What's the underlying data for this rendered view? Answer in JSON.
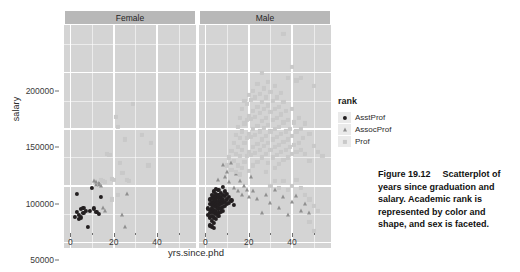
{
  "figure": {
    "caption_label": "Figure 19.12",
    "caption_text": "Scatterplot of years since graduation and salary. Academic rank is represented by color and shape, and sex is faceted."
  },
  "legend": {
    "title": "rank",
    "items": [
      {
        "label": "AsstProf",
        "shape": "circle",
        "color": "#231f20"
      },
      {
        "label": "AssocProf",
        "shape": "triangle",
        "color": "#8f8f8f"
      },
      {
        "label": "Prof",
        "shape": "square",
        "color": "#c9c9c9"
      }
    ]
  },
  "chart_data": {
    "type": "scatter",
    "title": "",
    "xlabel": "yrs.since.phd",
    "ylabel": "salary",
    "xlim": [
      -3,
      58
    ],
    "ylim": [
      45000,
      242000
    ],
    "grid": true,
    "legend_position": "right",
    "facet_variable": "sex",
    "facets": [
      "Female",
      "Male"
    ],
    "x_ticks": [
      0,
      20,
      40
    ],
    "x_tick_labels": [
      "0",
      "20",
      "40"
    ],
    "x_minor_ticks": [
      10,
      30,
      50
    ],
    "y_ticks": [
      50000,
      100000,
      150000,
      200000
    ],
    "y_tick_labels": [
      "50000",
      "100000",
      "150000",
      "200000"
    ],
    "y_minor_ticks": [
      75000,
      125000,
      175000,
      225000
    ],
    "color_variable": "rank",
    "shape_variable": "rank",
    "series": [
      {
        "name": "AsstProf",
        "facet": "Female",
        "shape": "circle",
        "color": "#231f20",
        "points": [
          [
            2,
            72500
          ],
          [
            3,
            93000
          ],
          [
            3,
            77000
          ],
          [
            4,
            74000
          ],
          [
            4,
            71000
          ],
          [
            5,
            79500
          ],
          [
            5,
            72000
          ],
          [
            6,
            80500
          ],
          [
            6,
            76000
          ],
          [
            7,
            77500
          ],
          [
            8,
            63500
          ],
          [
            9,
            78000
          ],
          [
            10,
            98000
          ],
          [
            11,
            80000
          ],
          [
            12,
            77000
          ],
          [
            13,
            75000
          ],
          [
            14,
            90000
          ]
        ]
      },
      {
        "name": "AssocProf",
        "facet": "Female",
        "shape": "triangle",
        "color": "#8f8f8f",
        "points": [
          [
            11,
            104000
          ],
          [
            12,
            103000
          ],
          [
            12,
            101000
          ],
          [
            13,
            102000
          ],
          [
            13,
            100500
          ],
          [
            14,
            99500
          ],
          [
            15,
            80000
          ],
          [
            16,
            78000
          ],
          [
            24,
            74000
          ],
          [
            25,
            63500
          ],
          [
            26,
            93000
          ]
        ]
      },
      {
        "name": "Prof",
        "facet": "Female",
        "shape": "square",
        "color": "#c9c9c9",
        "points": [
          [
            14,
            105000
          ],
          [
            15,
            104000
          ],
          [
            16,
            103500
          ],
          [
            17,
            128000
          ],
          [
            18,
            127000
          ],
          [
            19,
            106000
          ],
          [
            20,
            105000
          ],
          [
            21,
            161000
          ],
          [
            22,
            152000
          ],
          [
            23,
            120000
          ],
          [
            24,
            111000
          ],
          [
            25,
            141000
          ],
          [
            26,
            105000
          ],
          [
            27,
            104000
          ],
          [
            29,
            172000
          ],
          [
            33,
            145000
          ],
          [
            36,
            118000
          ],
          [
            37,
            138000
          ],
          [
            19,
            88000
          ],
          [
            22,
            92000
          ]
        ]
      },
      {
        "name": "AsstProf",
        "facet": "Male",
        "shape": "circle",
        "color": "#231f20",
        "points": [
          [
            1,
            80000
          ],
          [
            1,
            74000
          ],
          [
            2,
            88000
          ],
          [
            2,
            84000
          ],
          [
            2,
            79000
          ],
          [
            2,
            76000
          ],
          [
            2,
            72000
          ],
          [
            3,
            92000
          ],
          [
            3,
            89000
          ],
          [
            3,
            86000
          ],
          [
            3,
            83000
          ],
          [
            3,
            80000
          ],
          [
            3,
            77000
          ],
          [
            3,
            73000
          ],
          [
            3,
            69000
          ],
          [
            4,
            95000
          ],
          [
            4,
            91000
          ],
          [
            4,
            88000
          ],
          [
            4,
            85000
          ],
          [
            4,
            82000
          ],
          [
            4,
            79000
          ],
          [
            4,
            76000
          ],
          [
            4,
            72000
          ],
          [
            4,
            67000
          ],
          [
            5,
            97000
          ],
          [
            5,
            93000
          ],
          [
            5,
            90000
          ],
          [
            5,
            87000
          ],
          [
            5,
            84000
          ],
          [
            5,
            81000
          ],
          [
            5,
            78000
          ],
          [
            5,
            75000
          ],
          [
            5,
            71000
          ],
          [
            6,
            96000
          ],
          [
            6,
            92000
          ],
          [
            6,
            89000
          ],
          [
            6,
            86000
          ],
          [
            6,
            83000
          ],
          [
            6,
            80000
          ],
          [
            6,
            76000
          ],
          [
            6,
            73000
          ],
          [
            7,
            94000
          ],
          [
            7,
            90000
          ],
          [
            7,
            87000
          ],
          [
            7,
            84000
          ],
          [
            7,
            80000
          ],
          [
            7,
            77000
          ],
          [
            8,
            99000
          ],
          [
            8,
            92000
          ],
          [
            8,
            88000
          ],
          [
            8,
            85000
          ],
          [
            8,
            81000
          ],
          [
            8,
            78000
          ],
          [
            9,
            95000
          ],
          [
            9,
            91000
          ],
          [
            9,
            86000
          ],
          [
            9,
            82000
          ],
          [
            10,
            93000
          ],
          [
            10,
            88000
          ],
          [
            10,
            84000
          ],
          [
            11,
            90000
          ],
          [
            11,
            85000
          ],
          [
            12,
            87000
          ],
          [
            13,
            83000
          ],
          [
            2,
            65000
          ],
          [
            3,
            64000
          ],
          [
            4,
            63000
          ]
        ]
      },
      {
        "name": "AssocProf",
        "facet": "Male",
        "shape": "triangle",
        "color": "#8f8f8f",
        "points": [
          [
            6,
            105000
          ],
          [
            8,
            118000
          ],
          [
            9,
            108000
          ],
          [
            10,
            112000
          ],
          [
            11,
            103000
          ],
          [
            12,
            120000
          ],
          [
            13,
            98000
          ],
          [
            14,
            110000
          ],
          [
            15,
            95000
          ],
          [
            16,
            104000
          ],
          [
            17,
            92000
          ],
          [
            18,
            100000
          ],
          [
            19,
            96000
          ],
          [
            20,
            90000
          ],
          [
            21,
            108000
          ],
          [
            22,
            95000
          ],
          [
            24,
            88000
          ],
          [
            26,
            76000
          ],
          [
            28,
            92000
          ],
          [
            30,
            85000
          ],
          [
            32,
            96000
          ],
          [
            34,
            80000
          ],
          [
            36,
            90000
          ],
          [
            38,
            74000
          ],
          [
            40,
            86000
          ],
          [
            42,
            91000
          ],
          [
            44,
            78000
          ],
          [
            46,
            84000
          ],
          [
            48,
            76000
          ]
        ]
      },
      {
        "name": "Prof",
        "facet": "Male",
        "shape": "square",
        "color": "#c9c9c9",
        "points": [
          [
            10,
            118000
          ],
          [
            11,
            125000
          ],
          [
            12,
            131000
          ],
          [
            12,
            114000
          ],
          [
            13,
            138000
          ],
          [
            13,
            122000
          ],
          [
            14,
            145000
          ],
          [
            14,
            128000
          ],
          [
            14,
            112000
          ],
          [
            15,
            152000
          ],
          [
            15,
            134000
          ],
          [
            15,
            118000
          ],
          [
            16,
            160000
          ],
          [
            16,
            142000
          ],
          [
            16,
            126000
          ],
          [
            16,
            110000
          ],
          [
            17,
            168000
          ],
          [
            17,
            148000
          ],
          [
            17,
            132000
          ],
          [
            17,
            116000
          ],
          [
            18,
            175000
          ],
          [
            18,
            155000
          ],
          [
            18,
            138000
          ],
          [
            18,
            121000
          ],
          [
            19,
            172000
          ],
          [
            19,
            158000
          ],
          [
            19,
            142000
          ],
          [
            19,
            126000
          ],
          [
            20,
            180000
          ],
          [
            20,
            162000
          ],
          [
            20,
            146000
          ],
          [
            20,
            130000
          ],
          [
            20,
            113000
          ],
          [
            21,
            176000
          ],
          [
            21,
            159000
          ],
          [
            21,
            143000
          ],
          [
            21,
            127000
          ],
          [
            22,
            184000
          ],
          [
            22,
            166000
          ],
          [
            22,
            150000
          ],
          [
            22,
            134000
          ],
          [
            22,
            118000
          ],
          [
            23,
            178000
          ],
          [
            23,
            161000
          ],
          [
            23,
            145000
          ],
          [
            23,
            129000
          ],
          [
            24,
            190000
          ],
          [
            24,
            170000
          ],
          [
            24,
            153000
          ],
          [
            24,
            137000
          ],
          [
            24,
            121000
          ],
          [
            25,
            181000
          ],
          [
            25,
            164000
          ],
          [
            25,
            148000
          ],
          [
            25,
            132000
          ],
          [
            26,
            200000
          ],
          [
            26,
            174000
          ],
          [
            26,
            157000
          ],
          [
            26,
            141000
          ],
          [
            26,
            125000
          ],
          [
            27,
            186000
          ],
          [
            27,
            168000
          ],
          [
            27,
            151000
          ],
          [
            27,
            135000
          ],
          [
            28,
            178000
          ],
          [
            28,
            160000
          ],
          [
            28,
            144000
          ],
          [
            28,
            128000
          ],
          [
            28,
            112000
          ],
          [
            29,
            192000
          ],
          [
            29,
            171000
          ],
          [
            29,
            154000
          ],
          [
            29,
            138000
          ],
          [
            29,
            120000
          ],
          [
            30,
            183000
          ],
          [
            30,
            165000
          ],
          [
            30,
            148000
          ],
          [
            30,
            132000
          ],
          [
            31,
            175000
          ],
          [
            31,
            158000
          ],
          [
            31,
            141000
          ],
          [
            31,
            125000
          ],
          [
            32,
            188000
          ],
          [
            32,
            168000
          ],
          [
            32,
            150000
          ],
          [
            32,
            134000
          ],
          [
            32,
            116000
          ],
          [
            33,
            178000
          ],
          [
            33,
            160000
          ],
          [
            33,
            143000
          ],
          [
            33,
            127000
          ],
          [
            34,
            170000
          ],
          [
            34,
            152000
          ],
          [
            34,
            136000
          ],
          [
            34,
            119000
          ],
          [
            35,
            182000
          ],
          [
            35,
            163000
          ],
          [
            35,
            146000
          ],
          [
            35,
            130000
          ],
          [
            36,
            234000
          ],
          [
            36,
            174000
          ],
          [
            36,
            156000
          ],
          [
            36,
            139000
          ],
          [
            36,
            123000
          ],
          [
            37,
            166000
          ],
          [
            37,
            148000
          ],
          [
            37,
            132000
          ],
          [
            38,
            195000
          ],
          [
            38,
            158000
          ],
          [
            38,
            141000
          ],
          [
            38,
            125000
          ],
          [
            39,
            150000
          ],
          [
            39,
            134000
          ],
          [
            40,
            205000
          ],
          [
            40,
            168000
          ],
          [
            40,
            144000
          ],
          [
            40,
            128000
          ],
          [
            41,
            156000
          ],
          [
            41,
            136000
          ],
          [
            42,
            193000
          ],
          [
            42,
            148000
          ],
          [
            42,
            130000
          ],
          [
            43,
            160000
          ],
          [
            43,
            138000
          ],
          [
            44,
            195000
          ],
          [
            44,
            150000
          ],
          [
            44,
            132000
          ],
          [
            45,
            142000
          ],
          [
            46,
            155000
          ],
          [
            46,
            128000
          ],
          [
            48,
            146000
          ],
          [
            48,
            122000
          ],
          [
            50,
            188000
          ],
          [
            50,
            135000
          ],
          [
            52,
            130000
          ],
          [
            54,
            126000
          ],
          [
            42,
            105000
          ],
          [
            44,
            98000
          ],
          [
            46,
            92000
          ],
          [
            48,
            88000
          ],
          [
            50,
            82000
          ],
          [
            52,
            78000
          ],
          [
            48,
            68000
          ],
          [
            50,
            60000
          ],
          [
            30,
            100000
          ],
          [
            32,
            104000
          ],
          [
            34,
            98000
          ],
          [
            38,
            96000
          ],
          [
            40,
            100000
          ],
          [
            36,
            104000
          ]
        ]
      }
    ]
  }
}
